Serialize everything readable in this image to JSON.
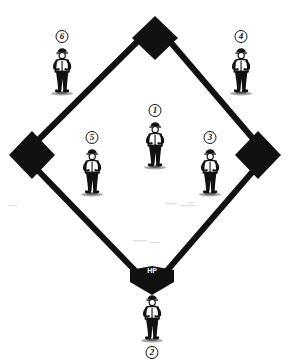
{
  "diagram": {
    "background_color": "#ffffff",
    "line_color": "#111111",
    "base_fill_color": "#111111",
    "home_plate_label": "HP",
    "home_plate_label_color": "#ffffff"
  },
  "bases": [
    {
      "name": "second-base",
      "label": "",
      "x": 155,
      "y": 35
    },
    {
      "name": "third-base",
      "label": "",
      "x": 32,
      "y": 155
    },
    {
      "name": "first-base",
      "label": "",
      "x": 258,
      "y": 155
    },
    {
      "name": "home-plate",
      "label": "HP",
      "x": 152,
      "y": 277
    }
  ],
  "players": [
    {
      "name": "player-6-left-field",
      "number": "6",
      "badge_position": "top",
      "x": 62,
      "y": 30
    },
    {
      "name": "player-4-right-field",
      "number": "4",
      "badge_position": "top",
      "x": 241,
      "y": 30
    },
    {
      "name": "player-1-pitcher",
      "number": "1",
      "badge_position": "top",
      "x": 155,
      "y": 104
    },
    {
      "name": "player-5-third-base",
      "number": "5",
      "badge_position": "top",
      "x": 92,
      "y": 131
    },
    {
      "name": "player-3-first-base",
      "number": "3",
      "badge_position": "top",
      "x": 210,
      "y": 131
    },
    {
      "name": "player-2-catcher",
      "number": "2",
      "badge_position": "bottom",
      "x": 152,
      "y": 291
    }
  ]
}
